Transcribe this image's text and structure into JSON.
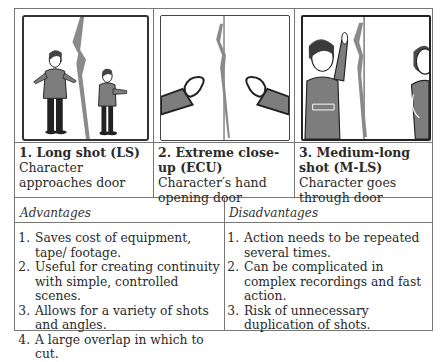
{
  "shots": [
    {
      "number": "1.",
      "title": "1. Long shot (LS)",
      "description": "Character approaches door",
      "panel": "long-shot-panel"
    },
    {
      "number": "2.",
      "title": "2. Extreme close-up (ECU)",
      "description": "Character′s hand opening door",
      "panel": "extreme-closeup-panel"
    },
    {
      "number": "3.",
      "title": "3. Medium-long shot (M-LS)",
      "description": "Character goes through door",
      "panel": "medium-long-shot-panel"
    }
  ],
  "advantages": {
    "heading": "Advantages",
    "items": [
      "Saves cost of equipment, tape/ footage.",
      "Useful for creating continuity with simple, controlled scenes.",
      "Allows for a variety of shots and angles.",
      "A large overlap in which to cut."
    ]
  },
  "disadvantages": {
    "heading": "Disadvantages",
    "items": [
      "Action needs to be repeated several times.",
      "Can be complicated in complex recordings and fast action.",
      "Risk of unnecessary duplication of shots."
    ]
  },
  "colors": {
    "border": "#777777",
    "figure_gray": "#7d7d7d",
    "outline": "#222222"
  }
}
